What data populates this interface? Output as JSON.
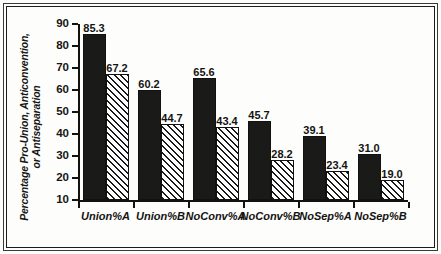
{
  "chart_data": {
    "type": "bar",
    "title": "",
    "xlabel": "",
    "ylabel_line1": "Percentage Pro-Union, Anticonvention,",
    "ylabel_line2": "or Antiseparation",
    "categories": [
      "Union%A",
      "Union%B",
      "NoConv%A",
      "NoConv%B",
      "NoSep%A",
      "NoSep%B"
    ],
    "series": [
      {
        "name": "solid",
        "style": "solid-black",
        "values": [
          85.3,
          60.2,
          65.6,
          45.7,
          39.1,
          31.0
        ]
      },
      {
        "name": "hatched",
        "style": "diagonal-hatch",
        "values": [
          67.2,
          44.7,
          43.4,
          28.2,
          23.4,
          19.0
        ]
      }
    ],
    "value_labels": [
      "85.3",
      "67.2",
      "60.2",
      "44.7",
      "65.6",
      "43.4",
      "45.7",
      "28.2",
      "39.1",
      "23.4",
      "31.0",
      "19.0"
    ],
    "ylim": [
      10,
      90
    ],
    "yticks": [
      10,
      20,
      30,
      40,
      50,
      60,
      70,
      80,
      90
    ],
    "ytick_labels": [
      "10",
      "20",
      "30",
      "40",
      "50",
      "60",
      "70",
      "80",
      "90"
    ],
    "grid": false,
    "legend": "none",
    "legend_position": "none",
    "colors": {
      "bar_solid": "#1a1a18",
      "bar_hatch_line": "#1a1a18",
      "bar_hatch_background": "#ffffff",
      "axis": "#121210",
      "text": "#161614",
      "frame": "#1c1c1a",
      "background": "#fdfdfb"
    }
  }
}
